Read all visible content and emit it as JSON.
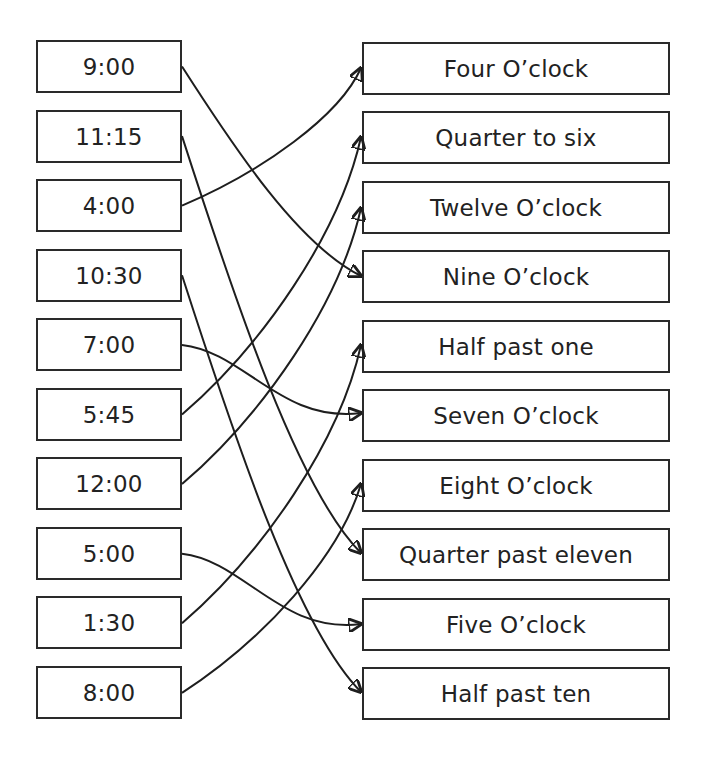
{
  "left_items": [
    {
      "label": "9:00"
    },
    {
      "label": "11:15"
    },
    {
      "label": "4:00"
    },
    {
      "label": "10:30"
    },
    {
      "label": "7:00"
    },
    {
      "label": "5:45"
    },
    {
      "label": "12:00"
    },
    {
      "label": "5:00"
    },
    {
      "label": "1:30"
    },
    {
      "label": "8:00"
    }
  ],
  "right_items": [
    {
      "label": "Four O’clock"
    },
    {
      "label": "Quarter to six"
    },
    {
      "label": "Twelve O’clock"
    },
    {
      "label": "Nine O’clock"
    },
    {
      "label": "Half past one"
    },
    {
      "label": "Seven O’clock"
    },
    {
      "label": "Eight O’clock"
    },
    {
      "label": "Quarter past eleven"
    },
    {
      "label": "Five O’clock"
    },
    {
      "label": "Half past ten"
    }
  ],
  "connections": [
    {
      "from": "9:00",
      "to": "Nine O’clock",
      "from_index": 0,
      "to_index": 3,
      "end_y": 276
    },
    {
      "from": "11:15",
      "to": "Quarter past eleven",
      "from_index": 1,
      "to_index": 7,
      "end_y": 553
    },
    {
      "from": "4:00",
      "to": "Four O’clock",
      "from_index": 2,
      "to_index": 0,
      "end_y": 68
    },
    {
      "from": "10:30",
      "to": "Half past ten",
      "from_index": 3,
      "to_index": 9,
      "end_y": 692
    },
    {
      "from": "7:00",
      "to": "Seven O’clock",
      "from_index": 4,
      "to_index": 5,
      "end_y": 413
    },
    {
      "from": "5:45",
      "to": "Quarter to six",
      "from_index": 5,
      "to_index": 1,
      "end_y": 137
    },
    {
      "from": "12:00",
      "to": "Twelve O’clock",
      "from_index": 6,
      "to_index": 2,
      "end_y": 208
    },
    {
      "from": "5:00",
      "to": "Five O’clock",
      "from_index": 7,
      "to_index": 8,
      "end_y": 624
    },
    {
      "from": "1:30",
      "to": "Half past one",
      "from_index": 8,
      "to_index": 4,
      "end_y": 345
    },
    {
      "from": "8:00",
      "to": "Eight O’clock",
      "from_index": 9,
      "to_index": 6,
      "end_y": 484
    }
  ],
  "colors": {
    "stroke": "#1e1e1e",
    "text": "#222222",
    "background": "#ffffff"
  }
}
